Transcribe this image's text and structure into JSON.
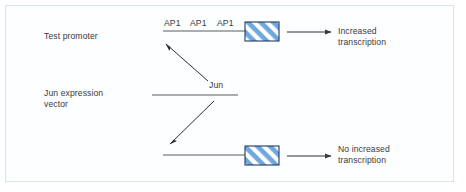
{
  "figure": {
    "background_color": "#ffffff",
    "frame_color": "#d7e3ee",
    "line_color": "#5a5a5a",
    "text_color": "#3a3a3a",
    "box_fill_color": "#6fa8dc",
    "box_stripe_color": "#ffffff",
    "box_border_color": "#1f3864"
  },
  "labels": {
    "test_promoter": "Test promoter",
    "jun_expression_vector": "Jun expression\nvector",
    "jun": "Jun",
    "ap1_sites": [
      "AP1",
      "AP1",
      "AP1"
    ],
    "increased_transcription": "Increased\ntranscription",
    "no_increased_transcription": "No increased\ntranscription"
  },
  "elements": {
    "top_promoter_line": {
      "x1": 163,
      "y1": 31,
      "x2": 245,
      "y2": 31
    },
    "bottom_promoter_line": {
      "x1": 163,
      "y1": 155,
      "x2": 245,
      "y2": 155
    },
    "jun_vector_line": {
      "x1": 152,
      "y1": 95,
      "x2": 238,
      "y2": 95
    },
    "top_gene_box": {
      "x": 245,
      "y": 22,
      "w": 34,
      "h": 19
    },
    "bottom_gene_box": {
      "x": 245,
      "y": 146,
      "w": 34,
      "h": 19
    },
    "top_output_arrow": {
      "x1": 286,
      "y1": 32,
      "x2": 332,
      "y2": 32
    },
    "bottom_output_arrow": {
      "x1": 286,
      "y1": 156,
      "x2": 332,
      "y2": 156
    },
    "jun_to_top_arrow": {
      "x1": 207,
      "y1": 80,
      "x2": 166,
      "y2": 44
    },
    "jun_to_bottom_arrow": {
      "x1": 213,
      "y1": 101,
      "x2": 170,
      "y2": 143
    }
  }
}
